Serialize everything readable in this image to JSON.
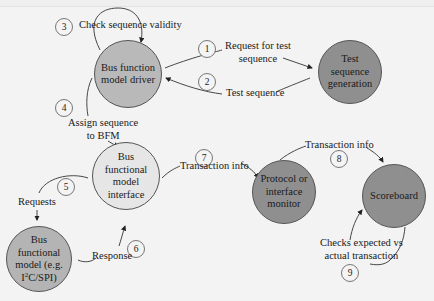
{
  "colors": {
    "background": "#f3f3f3",
    "node_medium": "#b9b9b9",
    "node_light": "#e4e4e4",
    "node_dark": "#8f8f8f",
    "stroke": "#333333"
  },
  "nodes": {
    "driver": {
      "line1": "Bus function",
      "line2": "model driver"
    },
    "generation": {
      "line1": "Test sequence",
      "line2": "generation"
    },
    "interface": {
      "line1": "Bus",
      "line2": "functional",
      "line3": "model",
      "line4": "interface"
    },
    "bfm": {
      "line1": "Bus",
      "line2": "functional",
      "line3": "model (e.g.",
      "line4_pre": "I",
      "line4_sup": "2",
      "line4_post": "C/SPI)"
    },
    "monitor": {
      "line1": "Protocol or",
      "line2": "interface",
      "line3": "monitor"
    },
    "scoreboard": {
      "line1": "Scoreboard"
    }
  },
  "steps": [
    {
      "number": "1",
      "label_line1": "Request for test",
      "label_line2": "sequence"
    },
    {
      "number": "2",
      "label_line1": "Test sequence"
    },
    {
      "number": "3",
      "label_line1": "Check sequence validity"
    },
    {
      "number": "4",
      "label_line1": "Assign sequence",
      "label_line2": "to BFM"
    },
    {
      "number": "5",
      "label_line1": "Requests"
    },
    {
      "number": "6",
      "label_line1": "Response"
    },
    {
      "number": "7",
      "label_line1": "Transaction info"
    },
    {
      "number": "8",
      "label_line1": "Transaction info"
    },
    {
      "number": "9",
      "label_line1": "Checks expected vs",
      "label_line2": "actual transaction"
    }
  ]
}
